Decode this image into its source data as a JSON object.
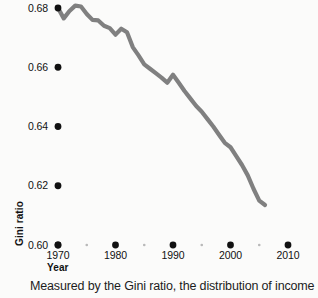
{
  "chart_data": {
    "type": "line",
    "title": "",
    "xlabel": "Year",
    "ylabel": "Gini ratio",
    "xlim": [
      1970,
      2010
    ],
    "ylim": [
      0.6,
      0.68
    ],
    "grid": false,
    "legend": "none",
    "line_color": "#808080",
    "marker_color": "#111111",
    "x_ticks_major": [
      "1970",
      "1980",
      "1990",
      "2000",
      "2010"
    ],
    "x_ticks_major_values": [
      1970,
      1980,
      1990,
      2000,
      2010
    ],
    "x_ticks_minor_values": [
      1975,
      1985,
      1995,
      2005
    ],
    "y_ticks": [
      "0.60",
      "0.62",
      "0.64",
      "0.66",
      "0.68"
    ],
    "y_ticks_values": [
      0.6,
      0.62,
      0.64,
      0.66,
      0.68
    ],
    "series": [
      {
        "name": "Gini ratio",
        "x": [
          1970,
          1971,
          1972,
          1973,
          1974,
          1975,
          1976,
          1977,
          1978,
          1979,
          1980,
          1981,
          1982,
          1983,
          1984,
          1985,
          1986,
          1987,
          1988,
          1989,
          1990,
          1991,
          1992,
          1993,
          1994,
          1995,
          1996,
          1997,
          1998,
          1999,
          2000,
          2001,
          2002,
          2003,
          2004,
          2005,
          2006
        ],
        "y": [
          0.68,
          0.6765,
          0.679,
          0.6808,
          0.6805,
          0.678,
          0.676,
          0.6758,
          0.674,
          0.6732,
          0.671,
          0.673,
          0.6718,
          0.6668,
          0.664,
          0.661,
          0.6595,
          0.658,
          0.6565,
          0.6548,
          0.6575,
          0.6548,
          0.652,
          0.6495,
          0.647,
          0.645,
          0.6425,
          0.64,
          0.6372,
          0.6345,
          0.633,
          0.63,
          0.627,
          0.6235,
          0.619,
          0.615,
          0.6135
        ]
      }
    ]
  },
  "axes": {
    "y_title": "Gini ratio",
    "x_title": "Year"
  },
  "caption": {
    "text": "Measured by the Gini ratio, the distribution of income in the"
  }
}
